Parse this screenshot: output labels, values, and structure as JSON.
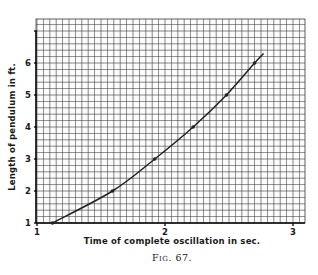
{
  "figure": {
    "caption": "Fig. 67."
  },
  "chart_data": {
    "type": "line",
    "title": "",
    "xlabel": "Time of complete oscillation in sec.",
    "ylabel": "Length of pendulum in ft.",
    "xlim": [
      1.0,
      3.1
    ],
    "ylim": [
      1.0,
      7.4
    ],
    "x_ticks": [
      1,
      2,
      3
    ],
    "y_ticks": [
      1,
      2,
      3,
      4,
      5,
      6,
      7
    ],
    "x_tick_labels": [
      "1",
      "2",
      "3"
    ],
    "y_tick_labels": [
      "1",
      "2",
      "3",
      "4",
      "5",
      "6",
      ""
    ],
    "grid": true,
    "grid_minor_x_step": 0.05,
    "grid_minor_y_step": 0.2,
    "legend": null,
    "series": [
      {
        "name": "Pendulum length vs period",
        "markers": true,
        "x": [
          1.12,
          1.59,
          1.92,
          2.22,
          2.48,
          2.7
        ],
        "y": [
          1,
          2,
          3,
          4,
          5,
          6
        ]
      }
    ],
    "curve_extent": {
      "x_start": 1.12,
      "x_end": 2.77,
      "y_end": 6.3
    },
    "colors": {
      "grid": "#3a3a3a",
      "curve": "#222222",
      "axis": "#111111"
    }
  }
}
